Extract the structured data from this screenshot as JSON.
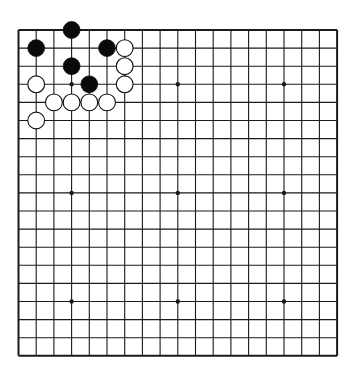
{
  "board": {
    "size": 19,
    "origin_x": 18.5,
    "origin_y": 30,
    "spacing_x": 17.7,
    "spacing_y": 18.1,
    "line_color": "#1a1a1a",
    "background": "#ffffff",
    "star_points": [
      [
        3,
        3
      ],
      [
        9,
        3
      ],
      [
        15,
        3
      ],
      [
        3,
        9
      ],
      [
        9,
        9
      ],
      [
        15,
        9
      ],
      [
        3,
        15
      ],
      [
        9,
        15
      ],
      [
        15,
        15
      ]
    ],
    "stones": [
      {
        "color": "black",
        "col": 3,
        "row": 0
      },
      {
        "color": "black",
        "col": 1,
        "row": 1
      },
      {
        "color": "black",
        "col": 5,
        "row": 1
      },
      {
        "color": "white",
        "col": 6,
        "row": 1
      },
      {
        "color": "black",
        "col": 3,
        "row": 2
      },
      {
        "color": "white",
        "col": 6,
        "row": 2
      },
      {
        "color": "white",
        "col": 1,
        "row": 3
      },
      {
        "color": "black",
        "col": 4,
        "row": 3
      },
      {
        "color": "white",
        "col": 6,
        "row": 3
      },
      {
        "color": "white",
        "col": 2,
        "row": 4
      },
      {
        "color": "white",
        "col": 3,
        "row": 4
      },
      {
        "color": "white",
        "col": 4,
        "row": 4
      },
      {
        "color": "white",
        "col": 5,
        "row": 4
      },
      {
        "color": "white",
        "col": 1,
        "row": 5
      }
    ]
  }
}
